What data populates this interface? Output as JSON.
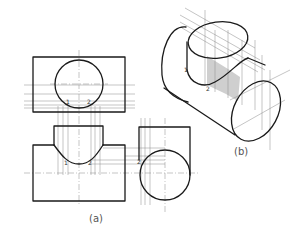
{
  "figure": {
    "views": {
      "orthographic": {
        "label": "(a)",
        "top_view_points": [
          "1",
          "2"
        ],
        "front_view_points": [
          "1",
          "2"
        ],
        "side_view_points": [
          "2",
          "1"
        ]
      },
      "isometric": {
        "label": "(b)",
        "points": [
          "1",
          "2"
        ]
      }
    },
    "colors": {
      "outline": "#1a1a1a",
      "construction": "#8a8a8a",
      "shade": "#cfcfcf"
    }
  }
}
